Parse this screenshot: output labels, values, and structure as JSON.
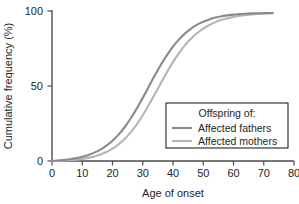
{
  "chart_data": {
    "type": "line",
    "title": "",
    "subtitle": "",
    "xlabel": "Age of onset",
    "ylabel": "Cumulative frequency (%)",
    "xlim": [
      0,
      80
    ],
    "ylim": [
      0,
      100
    ],
    "xticks": [
      0,
      10,
      20,
      30,
      40,
      50,
      60,
      70,
      80
    ],
    "xtick_labels": [
      "0",
      "10",
      "20",
      "30",
      "40",
      "50",
      "60",
      "70",
      "80"
    ],
    "yticks": [
      0,
      50,
      100
    ],
    "ytick_labels": [
      "0",
      "50",
      "100"
    ],
    "grid": false,
    "legend_position": "lower right",
    "legend_title": "Offspring of:",
    "series": [
      {
        "name": "Affected fathers",
        "color": "#8a8a8a",
        "x": [
          0,
          2,
          4,
          6,
          8,
          10,
          12,
          14,
          16,
          18,
          20,
          22,
          24,
          26,
          28,
          30,
          32,
          34,
          36,
          38,
          40,
          42,
          44,
          46,
          48,
          50,
          52,
          54,
          56,
          58,
          60,
          62,
          64,
          66,
          68,
          70,
          72,
          73
        ],
        "values": [
          0,
          0.3,
          0.7,
          1.2,
          1.9,
          2.8,
          4.0,
          5.6,
          7.6,
          10.2,
          13.5,
          17.6,
          22.5,
          28.3,
          34.9,
          42.1,
          49.6,
          57.1,
          64.2,
          70.6,
          76.3,
          81.1,
          85.1,
          88.3,
          90.9,
          92.9,
          94.4,
          95.6,
          96.5,
          97.1,
          97.6,
          97.9,
          98.2,
          98.4,
          98.5,
          98.6,
          98.7,
          98.7
        ]
      },
      {
        "name": "Affected mothers",
        "color": "#b5b5b5",
        "x": [
          0,
          2,
          4,
          6,
          8,
          10,
          12,
          14,
          16,
          18,
          20,
          22,
          24,
          26,
          28,
          30,
          32,
          34,
          36,
          38,
          40,
          42,
          44,
          46,
          48,
          50,
          52,
          54,
          56,
          58,
          60,
          62,
          64,
          66,
          68,
          70,
          72,
          73
        ],
        "values": [
          0,
          0.1,
          0.3,
          0.5,
          0.9,
          1.4,
          2.1,
          3.0,
          4.3,
          6.0,
          8.2,
          11.1,
          14.7,
          19.1,
          24.4,
          30.5,
          37.3,
          44.6,
          52.0,
          59.2,
          65.9,
          71.9,
          77.2,
          81.6,
          85.3,
          88.3,
          90.7,
          92.6,
          94.1,
          95.2,
          96.1,
          96.8,
          97.3,
          97.7,
          98.0,
          98.2,
          98.4,
          98.5
        ]
      }
    ]
  },
  "legend": {
    "title": "Offspring of:",
    "entries": [
      {
        "label": "Affected fathers",
        "color": "#8a8a8a"
      },
      {
        "label": "Affected mothers",
        "color": "#b5b5b5"
      }
    ],
    "border_color": "#231f20",
    "background": "#ffffff"
  },
  "axes": {
    "x_title": "Age of onset",
    "y_title": "Cumulative frequency (%)",
    "axis_color": "#4d4d4d",
    "x_tick_labels": [
      "0",
      "10",
      "20",
      "30",
      "40",
      "50",
      "60",
      "70",
      "80"
    ],
    "y_tick_labels": [
      "0",
      "50",
      "100"
    ]
  },
  "colors": {
    "background": "#ffffff",
    "text": "#231f20",
    "fathers": "#8a8a8a",
    "mothers": "#b5b5b5",
    "axis": "#4d4d4d"
  }
}
